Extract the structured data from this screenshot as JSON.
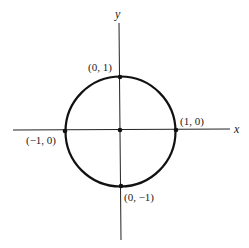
{
  "diagram": {
    "type": "unit-circle",
    "axes": {
      "x_label": "x",
      "y_label": "y"
    },
    "center": "origin",
    "radius": 1,
    "points": [
      {
        "label": "(0, 1)",
        "x": 0,
        "y": 1
      },
      {
        "label": "(1, 0)",
        "x": 1,
        "y": 0
      },
      {
        "label": "(−1, 0)",
        "x": -1,
        "y": 0
      },
      {
        "label": "(0, −1)",
        "x": 0,
        "y": -1
      }
    ],
    "colors": {
      "stroke": "#111111",
      "background": "#ffffff"
    }
  }
}
